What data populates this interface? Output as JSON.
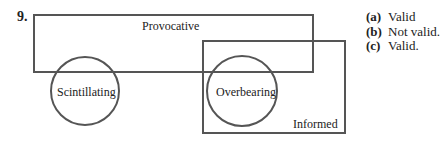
{
  "question": {
    "number": "9."
  },
  "diagram": {
    "type": "venn",
    "stroke_color": "#555555",
    "sets": [
      {
        "label": "Provocative",
        "shape": "rectangle"
      },
      {
        "label": "Informed",
        "shape": "rectangle"
      },
      {
        "label": "Scintillating",
        "shape": "circle"
      },
      {
        "label": "Overbearing",
        "shape": "circle"
      }
    ]
  },
  "answers": [
    {
      "key": "(a)",
      "text": "Valid"
    },
    {
      "key": "(b)",
      "text": "Not valid."
    },
    {
      "key": "(c)",
      "text": "Valid."
    }
  ]
}
